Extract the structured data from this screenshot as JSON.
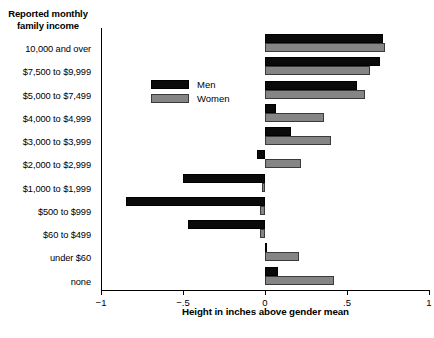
{
  "chart_data": {
    "type": "bar",
    "orientation": "horizontal",
    "title": "",
    "xlabel": "Height in inches above gender mean",
    "ylabel": "Reported monthly family income",
    "xlim": [
      -1,
      1
    ],
    "xticks": [
      -1,
      -0.5,
      0,
      0.5,
      1
    ],
    "xticklabels": [
      "−1",
      "−.5",
      "0",
      ".5",
      "1"
    ],
    "grid": false,
    "legend_position": "upper-left-inside",
    "categories": [
      "10,000 and over",
      "$7,500 to $9,999",
      "$5,000 to $7,499",
      "$4,000 to $4,999",
      "$3,000 to $3,999",
      "$2,000 to $2,999",
      "$1,000 to $1,999",
      "$500 to $999",
      "$60 to $499",
      "under $60",
      "none"
    ],
    "series": [
      {
        "name": "Men",
        "color": "#0a0a0a",
        "values": [
          0.72,
          0.7,
          0.56,
          0.07,
          0.16,
          -0.05,
          -0.5,
          -0.85,
          -0.47,
          0.01,
          0.08
        ]
      },
      {
        "name": "Women",
        "color": "#858585",
        "values": [
          0.73,
          0.64,
          0.61,
          0.36,
          0.4,
          0.22,
          -0.02,
          -0.03,
          -0.03,
          0.21,
          0.42
        ]
      }
    ]
  },
  "legend": {
    "items": [
      {
        "label": "Men",
        "key": "men"
      },
      {
        "label": "Women",
        "key": "women"
      }
    ]
  }
}
